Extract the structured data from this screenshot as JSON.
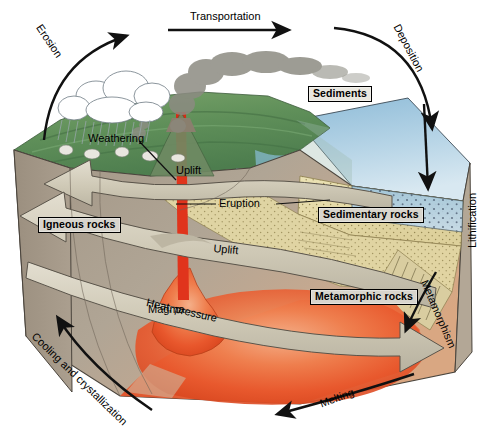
{
  "figure": {
    "type": "geological-block-diagram",
    "width": 480,
    "height": 431
  },
  "rock_types": [
    {
      "id": "igneous",
      "label": "Igneous rocks",
      "x": 38,
      "y": 218
    },
    {
      "id": "sedimentary",
      "label": "Sedimentary rocks",
      "x": 318,
      "y": 208
    },
    {
      "id": "metamorphic",
      "label": "Metamorphic rocks",
      "x": 310,
      "y": 290
    }
  ],
  "processes": [
    {
      "id": "erosion",
      "label": "Erosion",
      "rotation": -58
    },
    {
      "id": "transportation",
      "label": "Transportation",
      "rotation": 0
    },
    {
      "id": "deposition",
      "label": "Deposition",
      "rotation": 62
    },
    {
      "id": "sediments",
      "label": "Sediments",
      "rotation": 0
    },
    {
      "id": "lithification",
      "label": "Lithification",
      "rotation": -90
    },
    {
      "id": "metamorphism",
      "label": "Metamorphism",
      "rotation": 67
    },
    {
      "id": "melting",
      "label": "Melting",
      "rotation": -22
    },
    {
      "id": "cooling",
      "label": "Cooling and crystallization",
      "rotation": 43
    },
    {
      "id": "heat-pressure",
      "label": "Heat, pressure",
      "rotation": 14
    },
    {
      "id": "uplift-lower",
      "label": "Uplift",
      "rotation": 5
    },
    {
      "id": "uplift-upper",
      "label": "Uplift",
      "rotation": 0
    },
    {
      "id": "eruption",
      "label": "Eruption",
      "rotation": 0
    },
    {
      "id": "weathering",
      "label": "Weathering",
      "rotation": 0
    },
    {
      "id": "magma",
      "label": "Magma",
      "rotation": 0
    }
  ],
  "colors": {
    "crust_face": "#a79b8b",
    "crust_side": "#9a8e7e",
    "crust_deep": "#bdb3a3",
    "magma_core": "#e7552b",
    "magma_glow": "#f2writes",
    "sediment": "#e6dcab",
    "ocean": "#9cc4dd",
    "land_green": "#6d9a63",
    "arrow_fill": "#cdc7b4",
    "outline": "#2a2a28",
    "label_box": "#d8d5cd"
  },
  "annotations": {
    "volcano_conduit": "red magma conduit rising to volcano vent",
    "rain_cloud": "white cumulus cloud with rainfall over eroding highland",
    "ash_plume": "grey volcanic ash plume drifting right"
  }
}
